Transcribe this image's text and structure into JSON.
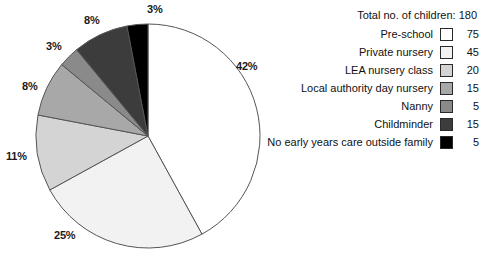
{
  "chart_data": {
    "type": "pie",
    "title": "",
    "total_label": "Total no. of children: 180",
    "total": 180,
    "categories": [
      "Pre-school",
      "Private nursery",
      "LEA nursery class",
      "Local authority day nursery",
      "Nanny",
      "Childminder",
      "No early years care outside family"
    ],
    "values": [
      75,
      45,
      20,
      15,
      5,
      15,
      5
    ],
    "percent_labels": [
      "42%",
      "25%",
      "11%",
      "8%",
      "3%",
      "8%",
      "3%"
    ],
    "percents": [
      42,
      25,
      11,
      8,
      3,
      8,
      3
    ],
    "colors": [
      "#ffffff",
      "#f2f2f2",
      "#d4d4d4",
      "#a8a8a8",
      "#8a8a8a",
      "#3c3c3c",
      "#000000"
    ],
    "stroke_color": "#555555",
    "start_angle_deg": 0,
    "direction": "clockwise",
    "legend_position": "right",
    "grid": false,
    "xlabel": "",
    "ylabel": ""
  },
  "legend": {
    "total_line": "Total no. of children: 180",
    "rows": [
      {
        "label": "Pre-school",
        "value": "75",
        "color": "#ffffff"
      },
      {
        "label": "Private nursery",
        "value": "45",
        "color": "#f2f2f2"
      },
      {
        "label": "LEA nursery class",
        "value": "20",
        "color": "#d4d4d4"
      },
      {
        "label": "Local authority day nursery",
        "value": "15",
        "color": "#a8a8a8"
      },
      {
        "label": "Nanny",
        "value": "5",
        "color": "#8a8a8a"
      },
      {
        "label": "Childminder",
        "value": "15",
        "color": "#3c3c3c"
      },
      {
        "label": "No early years care outside family",
        "value": "5",
        "color": "#000000"
      }
    ]
  },
  "pie_labels": [
    {
      "text": "42%",
      "left": 236,
      "top": 60
    },
    {
      "text": "25%",
      "left": 54,
      "top": 229
    },
    {
      "text": "11%",
      "left": 6,
      "top": 150
    },
    {
      "text": "8%",
      "left": 22,
      "top": 80
    },
    {
      "text": "3%",
      "left": 46,
      "top": 40
    },
    {
      "text": "8%",
      "left": 84,
      "top": 14
    },
    {
      "text": "3%",
      "left": 147,
      "top": 3
    }
  ]
}
